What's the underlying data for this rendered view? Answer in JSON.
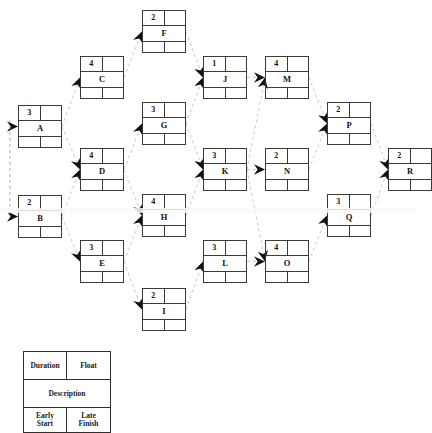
{
  "diagram": {
    "type": "precedence-network-diagram",
    "title": "",
    "edge_style": "dashed-arrow",
    "edge_color": "#c9c9c9",
    "arrowhead_color": "#111111",
    "node_border_color": "#3a3a3a",
    "background": "#ffffff"
  },
  "legend": {
    "duration_label": "Duration",
    "float_label": "Float",
    "description_label": "Description",
    "early_start_label": "Early\nStart",
    "early_start_line1": "Early",
    "early_start_line2": "Start",
    "late_finish_line1": "Late",
    "late_finish_line2": "Finish"
  },
  "nodes": [
    {
      "id": "A",
      "label": "A",
      "duration": "3",
      "float": "",
      "early_start": "",
      "late_finish": "",
      "x": 18,
      "y": 105
    },
    {
      "id": "B",
      "label": "B",
      "duration": "2",
      "float": "",
      "early_start": "",
      "late_finish": "",
      "x": 18,
      "y": 195
    },
    {
      "id": "C",
      "label": "C",
      "duration": "4",
      "float": "",
      "early_start": "",
      "late_finish": "",
      "x": 80,
      "y": 56
    },
    {
      "id": "D",
      "label": "D",
      "duration": "4",
      "float": "",
      "early_start": "",
      "late_finish": "",
      "x": 80,
      "y": 148
    },
    {
      "id": "E",
      "label": "E",
      "duration": "3",
      "float": "",
      "early_start": "",
      "late_finish": "",
      "x": 80,
      "y": 240
    },
    {
      "id": "F",
      "label": "F",
      "duration": "2",
      "float": "",
      "early_start": "",
      "late_finish": "",
      "x": 142,
      "y": 10
    },
    {
      "id": "G",
      "label": "G",
      "duration": "3",
      "float": "",
      "early_start": "",
      "late_finish": "",
      "x": 142,
      "y": 102
    },
    {
      "id": "H",
      "label": "H",
      "duration": "4",
      "float": "",
      "early_start": "",
      "late_finish": "",
      "x": 142,
      "y": 194
    },
    {
      "id": "I",
      "label": "I",
      "duration": "2",
      "float": "",
      "early_start": "",
      "late_finish": "",
      "x": 142,
      "y": 288
    },
    {
      "id": "J",
      "label": "J",
      "duration": "1",
      "float": "",
      "early_start": "",
      "late_finish": "",
      "x": 203,
      "y": 56
    },
    {
      "id": "K",
      "label": "K",
      "duration": "3",
      "float": "",
      "early_start": "",
      "late_finish": "",
      "x": 203,
      "y": 148
    },
    {
      "id": "L",
      "label": "L",
      "duration": "3",
      "float": "",
      "early_start": "",
      "late_finish": "",
      "x": 203,
      "y": 240
    },
    {
      "id": "M",
      "label": "M",
      "duration": "4",
      "float": "",
      "early_start": "",
      "late_finish": "",
      "x": 265,
      "y": 56
    },
    {
      "id": "N",
      "label": "N",
      "duration": "2",
      "float": "",
      "early_start": "",
      "late_finish": "",
      "x": 265,
      "y": 148
    },
    {
      "id": "O",
      "label": "O",
      "duration": "4",
      "float": "",
      "early_start": "",
      "late_finish": "",
      "x": 265,
      "y": 240
    },
    {
      "id": "P",
      "label": "P",
      "duration": "2",
      "float": "",
      "early_start": "",
      "late_finish": "",
      "x": 327,
      "y": 102
    },
    {
      "id": "Q",
      "label": "Q",
      "duration": "3",
      "float": "",
      "early_start": "",
      "late_finish": "",
      "x": 327,
      "y": 194
    },
    {
      "id": "R",
      "label": "R",
      "duration": "2",
      "float": "",
      "early_start": "",
      "late_finish": "",
      "x": 388,
      "y": 148
    }
  ],
  "edges": [
    {
      "from": "START",
      "to": "A"
    },
    {
      "from": "START",
      "to": "B"
    },
    {
      "from": "A",
      "to": "C"
    },
    {
      "from": "A",
      "to": "D"
    },
    {
      "from": "B",
      "to": "D"
    },
    {
      "from": "B",
      "to": "E"
    },
    {
      "from": "C",
      "to": "F"
    },
    {
      "from": "D",
      "to": "G"
    },
    {
      "from": "D",
      "to": "H"
    },
    {
      "from": "E",
      "to": "H"
    },
    {
      "from": "E",
      "to": "I"
    },
    {
      "from": "F",
      "to": "J"
    },
    {
      "from": "G",
      "to": "J"
    },
    {
      "from": "G",
      "to": "K"
    },
    {
      "from": "H",
      "to": "K"
    },
    {
      "from": "I",
      "to": "L"
    },
    {
      "from": "J",
      "to": "M"
    },
    {
      "from": "K",
      "to": "M"
    },
    {
      "from": "K",
      "to": "N"
    },
    {
      "from": "K",
      "to": "O"
    },
    {
      "from": "L",
      "to": "O"
    },
    {
      "from": "M",
      "to": "P"
    },
    {
      "from": "N",
      "to": "P"
    },
    {
      "from": "O",
      "to": "Q"
    },
    {
      "from": "P",
      "to": "R"
    },
    {
      "from": "Q",
      "to": "R"
    }
  ]
}
